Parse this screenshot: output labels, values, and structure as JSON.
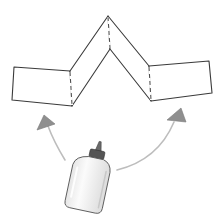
{
  "diagram": {
    "colors": {
      "background": "#ffffff",
      "outline": "#3a3a3a",
      "fold_line": "#4a4a4a",
      "arrow_fill": "#8a8a8a",
      "arrow_stroke": "#bdbdbd",
      "bottle_body": "#f4f4f4",
      "bottle_cap": "#555555"
    },
    "parts": [
      {
        "id": "left-flap",
        "label": ""
      },
      {
        "id": "left-slope",
        "label": ""
      },
      {
        "id": "right-slope",
        "label": ""
      },
      {
        "id": "right-flap",
        "label": ""
      },
      {
        "id": "glue-bottle",
        "label": ""
      },
      {
        "id": "arrow-left",
        "label": ""
      },
      {
        "id": "arrow-right",
        "label": ""
      }
    ]
  }
}
